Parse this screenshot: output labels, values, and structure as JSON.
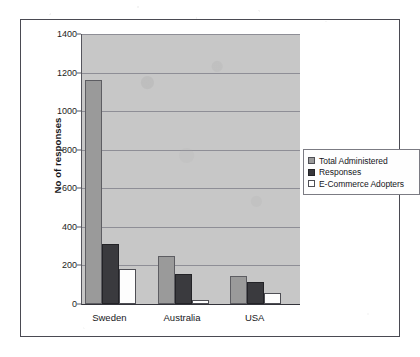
{
  "chart_data": {
    "type": "bar",
    "title": "",
    "xlabel": "",
    "ylabel": "No of responses",
    "categories": [
      "Sweden",
      "Australia",
      "USA"
    ],
    "series": [
      {
        "name": "Total Administered",
        "values": [
          1160,
          250,
          145
        ],
        "color": "#9a9a9a"
      },
      {
        "name": "Responses",
        "values": [
          310,
          155,
          115
        ],
        "color": "#3a3a3e"
      },
      {
        "name": "E-Commerce Adopters",
        "values": [
          180,
          20,
          55
        ],
        "color": "#ffffff"
      }
    ],
    "ylim": [
      0,
      1400
    ],
    "yticks": [
      0,
      200,
      400,
      600,
      800,
      1000,
      1200,
      1400
    ],
    "grid": true,
    "legend_position": "right",
    "plot_background": "#c7c7c7"
  }
}
